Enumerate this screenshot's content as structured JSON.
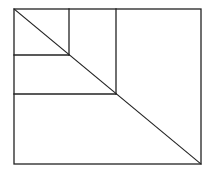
{
  "diagram": {
    "title": "",
    "colors": {
      "stroke": "#222222",
      "background": "#ffffff"
    },
    "shapes": [
      {
        "id": "outer-rectangle",
        "kind": "rectangle"
      },
      {
        "id": "diagonal",
        "kind": "line"
      },
      {
        "id": "small-square",
        "kind": "square"
      },
      {
        "id": "large-square",
        "kind": "square"
      }
    ]
  }
}
